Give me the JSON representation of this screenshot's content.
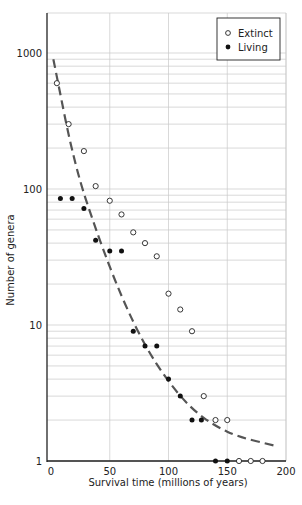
{
  "chart_data": {
    "type": "scatter",
    "title": "",
    "xlabel": "Survival time (millions of years)",
    "ylabel": "Number of genera",
    "xlim": [
      0,
      200
    ],
    "ylim": [
      1,
      1000
    ],
    "yscale": "log",
    "x_ticks": [
      "0",
      "50",
      "100",
      "150",
      "200"
    ],
    "y_ticks": [
      "1",
      "10",
      "100",
      "1000"
    ],
    "grid": true,
    "legend_position": "top-right",
    "series": [
      {
        "name": "Extinct",
        "marker": "open-circle",
        "x": [
          5,
          15,
          28,
          38,
          50,
          60,
          70,
          80,
          90,
          100,
          110,
          120,
          130,
          140,
          150,
          160,
          170,
          180
        ],
        "y": [
          600,
          300,
          190,
          105,
          82,
          65,
          48,
          40,
          32,
          17,
          13,
          9,
          3,
          2,
          2,
          1,
          1,
          1
        ]
      },
      {
        "name": "Living",
        "marker": "filled-circle",
        "x": [
          8,
          18,
          28,
          38,
          50,
          60,
          70,
          80,
          90,
          100,
          110,
          120,
          128,
          140,
          150
        ],
        "y": [
          85,
          85,
          72,
          42,
          35,
          35,
          9,
          7,
          7,
          4,
          3,
          2,
          2,
          1,
          1
        ]
      },
      {
        "name": "Fitted curve",
        "style": "dashed",
        "x": [
          2,
          20,
          40,
          60,
          80,
          100,
          120,
          140,
          160,
          190
        ],
        "y": [
          900,
          150,
          45,
          16,
          7,
          3.8,
          2.4,
          1.8,
          1.5,
          1.3
        ]
      }
    ]
  }
}
